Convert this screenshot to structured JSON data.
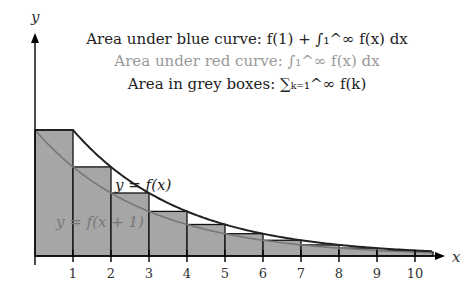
{
  "legend": {
    "blue": "Area under blue curve: f(1) + ∫₁^∞ f(x) dx",
    "red": "Area under red curve: ∫₁^∞ f(x) dx",
    "grey": "Area in grey boxes: ∑ₖ₌₁^∞ f(k)"
  },
  "axes": {
    "x_label": "x",
    "y_label": "y"
  },
  "curve_labels": {
    "upper": "y = f(x)",
    "lower": "y = f(x + 1)"
  },
  "chart_data": {
    "type": "area",
    "x_ticks": [
      "1",
      "2",
      "3",
      "4",
      "5",
      "6",
      "7",
      "8",
      "9",
      "10"
    ],
    "boxes_k": [
      1,
      2,
      3,
      4,
      5,
      6,
      7,
      8,
      9,
      10,
      11
    ],
    "box_heights_relative": [
      1.0,
      0.707,
      0.5,
      0.354,
      0.25,
      0.177,
      0.125,
      0.088,
      0.063,
      0.044,
      0.031
    ],
    "curves": [
      "f(x)",
      "f(x+1)"
    ]
  }
}
